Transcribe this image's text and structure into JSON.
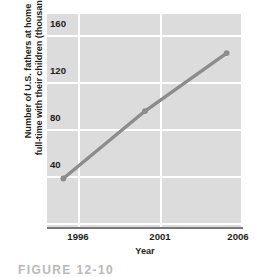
{
  "figure": {
    "caption": "FIGURE 12-10"
  },
  "chart_data": {
    "type": "line",
    "title": "",
    "xlabel": "Year",
    "ylabel": "Number of U.S. fathers at home full-time with their children (thousands)",
    "ylabel_lines": [
      "Number of U.S. fathers at home",
      "full-time with their children (thousands)"
    ],
    "x": [
      1996,
      2001,
      2006
    ],
    "values": [
      41,
      98,
      147
    ],
    "xtick_labels": [
      "1996",
      "2001",
      "2006"
    ],
    "ytick_labels": [
      "160",
      "120",
      "80",
      "40"
    ],
    "yticks": [
      160,
      120,
      80,
      40
    ],
    "xlim": [
      1995,
      2007
    ],
    "ylim": [
      0,
      180
    ],
    "grid": true,
    "legend": "none",
    "colors": {
      "panel_background": "#dcdcdc",
      "gridline": "#ffffff",
      "series_line": "#8c8c8c",
      "marker": "#8c8c8c",
      "axis_line": "#7a7a7a",
      "text": "#231f20"
    }
  }
}
